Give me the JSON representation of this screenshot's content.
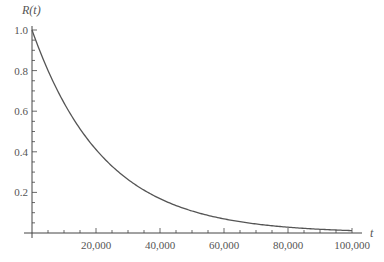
{
  "chart_data": {
    "type": "line",
    "title": "",
    "xlabel": "t",
    "ylabel": "R(t)",
    "xlim": [
      0,
      100000
    ],
    "ylim": [
      0,
      1.0
    ],
    "x_ticks": [
      20000,
      40000,
      60000,
      80000,
      100000
    ],
    "x_tick_labels": [
      "20,000",
      "40,000",
      "60,000",
      "80,000",
      "100,000"
    ],
    "y_ticks": [
      0.2,
      0.4,
      0.6,
      0.8,
      1.0
    ],
    "y_tick_labels": [
      "0.2",
      "0.4",
      "0.6",
      "0.8",
      "1.0"
    ],
    "grid": false,
    "legend": null,
    "series": [
      {
        "name": "R(t)",
        "x": [
          0,
          10000,
          20000,
          30000,
          40000,
          50000,
          60000,
          70000,
          80000,
          90000,
          100000
        ],
        "values": [
          1.0,
          0.64,
          0.41,
          0.26,
          0.17,
          0.11,
          0.07,
          0.045,
          0.03,
          0.02,
          0.012
        ],
        "color": "#555555"
      }
    ]
  }
}
